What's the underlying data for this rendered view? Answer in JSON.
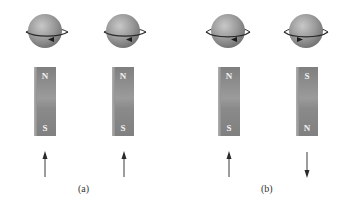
{
  "figure": {
    "panels": [
      {
        "label": "(a)",
        "items": [
          {
            "spin": "counterclockwise",
            "orbit_arrow": "left",
            "magnet_top": "N",
            "magnet_bottom": "S",
            "moment_arrow": "up"
          },
          {
            "spin": "counterclockwise",
            "orbit_arrow": "left",
            "magnet_top": "N",
            "magnet_bottom": "S",
            "moment_arrow": "up"
          }
        ]
      },
      {
        "label": "(b)",
        "items": [
          {
            "spin": "counterclockwise",
            "orbit_arrow": "left",
            "magnet_top": "N",
            "magnet_bottom": "S",
            "moment_arrow": "up"
          },
          {
            "spin": "clockwise",
            "orbit_arrow": "right",
            "magnet_top": "S",
            "magnet_bottom": "N",
            "moment_arrow": "down"
          }
        ]
      }
    ]
  },
  "colors": {
    "sphere": "#9a9a9a",
    "magnet": "#8c8c8c",
    "arrow": "#3a3a3a",
    "label_text": "#333333",
    "background": "#ffffff"
  },
  "icons": {
    "sphere": "spinning-electron-icon",
    "magnet": "bar-magnet-icon",
    "arrow_up": "arrow-up-icon",
    "arrow_down": "arrow-down-icon"
  }
}
